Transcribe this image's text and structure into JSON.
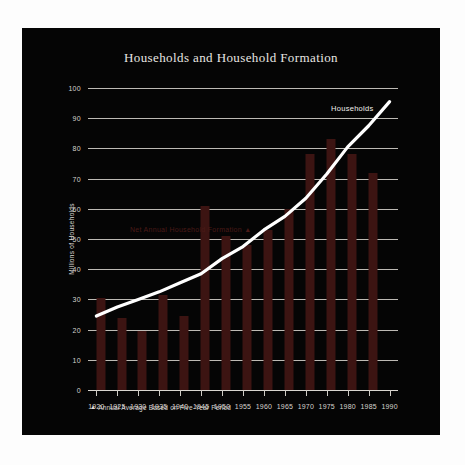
{
  "chart_data": {
    "type": "bar",
    "title": "Households and Household Formation",
    "xlabel": "",
    "ylabel": "Millions of Households",
    "categories": [
      "1920",
      "1925",
      "1930",
      "1935",
      "1940",
      "1945",
      "1950",
      "1955",
      "1960",
      "1965",
      "1970",
      "1975",
      "1980",
      "1985",
      "1990"
    ],
    "x_tick_labels": [
      "1920",
      "1925",
      "1930",
      "1935",
      "1940",
      "1945",
      "1950",
      "1955",
      "1960",
      "1965",
      "1970",
      "1975",
      "1980",
      "1985",
      "1990"
    ],
    "y_tick_labels": [
      "0",
      "10",
      "20",
      "30",
      "40",
      "50",
      "60",
      "70",
      "80",
      "90",
      "100"
    ],
    "y_ticks": [
      0,
      10,
      20,
      30,
      40,
      50,
      60,
      70,
      80,
      90,
      100
    ],
    "ylim": [
      0,
      100
    ],
    "xlim": [
      1918,
      1992
    ],
    "grid": true,
    "legend_position": "inline-annotation",
    "series": [
      {
        "name": "Net Annual Household Formation",
        "type": "bar",
        "color": "#3c1412",
        "note": "Annual Average Based on Five-Year Period",
        "x": [
          1921,
          1926,
          1931,
          1936,
          1941,
          1946,
          1951,
          1956,
          1961,
          1966,
          1971,
          1976,
          1981,
          1986
        ],
        "values": [
          30.5,
          24.0,
          19.5,
          31.5,
          24.5,
          61.0,
          51.0,
          48.0,
          53.0,
          60.0,
          78.0,
          83.0,
          78.0,
          72.0
        ]
      },
      {
        "name": "Households",
        "type": "line",
        "color": "#ffffff",
        "x": [
          1920,
          1925,
          1930,
          1935,
          1940,
          1945,
          1950,
          1955,
          1960,
          1965,
          1970,
          1975,
          1980,
          1985,
          1990
        ],
        "values": [
          24.5,
          27.5,
          30.0,
          32.5,
          35.5,
          38.5,
          43.5,
          47.5,
          53.0,
          57.5,
          63.5,
          71.5,
          80.5,
          87.5,
          95.5
        ]
      }
    ],
    "annotations": [
      {
        "text": "Households",
        "series": "Households"
      },
      {
        "text": "Net Annual Household Formation",
        "series": "Net Annual Household Formation"
      }
    ]
  },
  "labels": {
    "bars_annotation": "Net Annual Household Formation",
    "bars_annotation_marker": "▲",
    "line_label": "Households",
    "footnote_marker": "▲",
    "footnote_text": "Annual Average Based on Five-Year Period"
  },
  "colors": {
    "panel_background": "#050505",
    "page_background": "#fdfdfd",
    "bar": "#3c1412",
    "line": "#ffffff",
    "gridline": "#bdbab4",
    "text": "#d6d3cd",
    "title_text": "#e8e6e2"
  }
}
